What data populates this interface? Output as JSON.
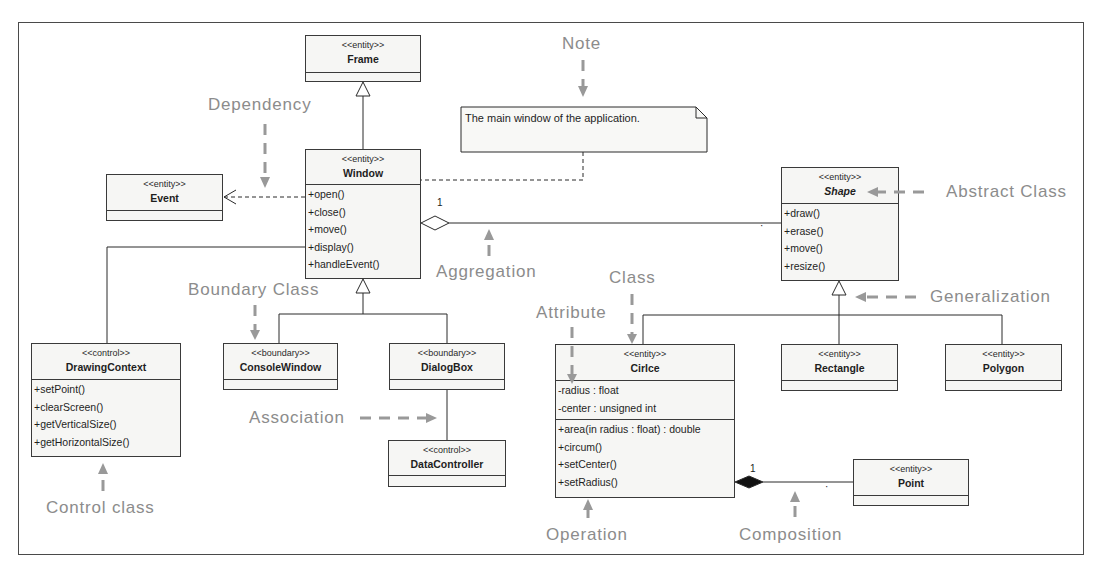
{
  "classes": {
    "frame": {
      "stereotype": "<<entity>>",
      "name": "Frame",
      "attributes": [],
      "operations": []
    },
    "window": {
      "stereotype": "<<entity>>",
      "name": "Window",
      "attributes": [],
      "operations": [
        "+open()",
        "+close()",
        "+move()",
        "+display()",
        "+handleEvent()"
      ]
    },
    "event": {
      "stereotype": "<<entity>>",
      "name": "Event",
      "attributes": [],
      "operations": []
    },
    "shape": {
      "stereotype": "<<entity>>",
      "name": "Shape",
      "abstract": true,
      "attributes": [],
      "operations": [
        "+draw()",
        "+erase()",
        "+move()",
        "+resize()"
      ]
    },
    "drawing_context": {
      "stereotype": "<<control>>",
      "name": "DrawingContext",
      "attributes": [],
      "operations": [
        "+setPoint()",
        "+clearScreen()",
        "+getVerticalSize()",
        "+getHorizontalSize()"
      ]
    },
    "console_window": {
      "stereotype": "<<boundary>>",
      "name": "ConsoleWindow",
      "attributes": [],
      "operations": []
    },
    "dialog_box": {
      "stereotype": "<<boundary>>",
      "name": "DialogBox",
      "attributes": [],
      "operations": []
    },
    "data_controller": {
      "stereotype": "<<control>>",
      "name": "DataController",
      "attributes": [],
      "operations": []
    },
    "circle": {
      "stereotype": "<<entity>>",
      "name": "Cirlce",
      "attributes": [
        "-radius : float",
        "-center : unsigned int"
      ],
      "operations": [
        "+area(in radius : float) : double",
        "+circum()",
        "+setCenter()",
        "+setRadius()"
      ]
    },
    "rectangle": {
      "stereotype": "<<entity>>",
      "name": "Rectangle",
      "attributes": [],
      "operations": []
    },
    "polygon": {
      "stereotype": "<<entity>>",
      "name": "Polygon",
      "attributes": [],
      "operations": []
    },
    "point": {
      "stereotype": "<<entity>>",
      "name": "Point",
      "attributes": [],
      "operations": []
    }
  },
  "note": {
    "text": "The main window of the application."
  },
  "multiplicities": {
    "aggregation_window_end": "1",
    "aggregation_shape_end": "·",
    "composition_circle_end": "1",
    "composition_point_end": "·"
  },
  "relationships": [
    {
      "type": "generalization",
      "from": "Window",
      "to": "Frame"
    },
    {
      "type": "dependency",
      "from": "Window",
      "to": "Event"
    },
    {
      "type": "aggregation",
      "whole": "Window",
      "part": "Shape"
    },
    {
      "type": "association",
      "from": "Window",
      "to": "DrawingContext"
    },
    {
      "type": "generalization",
      "from": "ConsoleWindow",
      "to": "Window"
    },
    {
      "type": "generalization",
      "from": "DialogBox",
      "to": "Window"
    },
    {
      "type": "association",
      "from": "DialogBox",
      "to": "DataController"
    },
    {
      "type": "generalization",
      "from": "Cirlce",
      "to": "Shape"
    },
    {
      "type": "generalization",
      "from": "Rectangle",
      "to": "Shape"
    },
    {
      "type": "generalization",
      "from": "Polygon",
      "to": "Shape"
    },
    {
      "type": "composition",
      "whole": "Cirlce",
      "part": "Point"
    },
    {
      "type": "note-anchor",
      "from": "Note",
      "to": "Window"
    }
  ],
  "annotations": {
    "note": "Note",
    "dependency": "Dependency",
    "abstract_class": "Abstract Class",
    "aggregation": "Aggregation",
    "generalization": "Generalization",
    "boundary_class": "Boundary Class",
    "class": "Class",
    "attribute": "Attribute",
    "association": "Association",
    "control_class": "Control class",
    "operation": "Operation",
    "composition": "Composition"
  },
  "colors": {
    "annotation": "#8c8c8c",
    "box_fill": "#f6f6f4",
    "box_border": "#3a3a3a",
    "line": "#2a2a2a"
  }
}
